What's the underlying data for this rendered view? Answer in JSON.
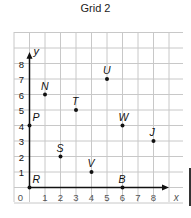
{
  "title": "Grid 2",
  "axes": {
    "x_label": "x",
    "y_label": "y",
    "x_ticks": [
      "0",
      "1",
      "2",
      "3",
      "4",
      "5",
      "6",
      "7",
      "8"
    ],
    "y_ticks": [
      "1",
      "2",
      "3",
      "4",
      "5",
      "6",
      "7",
      "8"
    ]
  },
  "points": [
    {
      "label": "N",
      "x": 1,
      "y": 6
    },
    {
      "label": "U",
      "x": 5,
      "y": 7
    },
    {
      "label": "T",
      "x": 3,
      "y": 5
    },
    {
      "label": "P",
      "x": 0,
      "y": 4
    },
    {
      "label": "W",
      "x": 6,
      "y": 4
    },
    {
      "label": "J",
      "x": 8,
      "y": 3
    },
    {
      "label": "S",
      "x": 2,
      "y": 2
    },
    {
      "label": "V",
      "x": 4,
      "y": 1
    },
    {
      "label": "R",
      "x": 0,
      "y": 0
    },
    {
      "label": "B",
      "x": 6,
      "y": 0
    }
  ],
  "colors": {
    "grid": "#c8c8c8",
    "axis": "#111111",
    "point": "#111111",
    "tick": "#555555"
  }
}
